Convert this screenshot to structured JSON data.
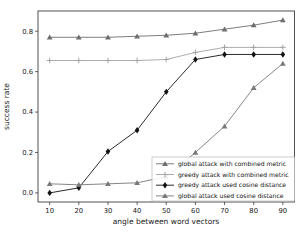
{
  "chart_data": {
    "type": "line",
    "title": "",
    "xlabel": "angle between word vectors",
    "ylabel": "success rate",
    "x": [
      10,
      20,
      30,
      40,
      50,
      60,
      70,
      80,
      90
    ],
    "xticks": [
      10,
      20,
      30,
      40,
      50,
      60,
      70,
      80,
      90
    ],
    "yticks": [
      0.0,
      0.2,
      0.4,
      0.6,
      0.8
    ],
    "xlim": [
      6,
      94
    ],
    "ylim": [
      -0.045,
      0.9
    ],
    "grid": false,
    "legend_position": "lower right",
    "axis_color": "#262626",
    "background_color": "#ffffff",
    "series": [
      {
        "name": "global attack with combined metric",
        "marker": "triangle",
        "color": "#6e6e6e",
        "values": [
          0.77,
          0.77,
          0.77,
          0.775,
          0.78,
          0.79,
          0.81,
          0.83,
          0.855
        ]
      },
      {
        "name": "greedy attack with combined metric",
        "marker": "plus",
        "color": "#a3a3a3",
        "values": [
          0.655,
          0.655,
          0.655,
          0.655,
          0.66,
          0.695,
          0.72,
          0.72,
          0.72
        ]
      },
      {
        "name": "greedy attack used cosine distance",
        "marker": "diamond",
        "color": "#141414",
        "values": [
          0.0,
          0.025,
          0.205,
          0.31,
          0.5,
          0.66,
          0.685,
          0.685,
          0.685
        ]
      },
      {
        "name": "global attack used cosine distance",
        "marker": "triangle",
        "color": "#787878",
        "values": [
          0.045,
          0.04,
          0.045,
          0.05,
          0.08,
          0.2,
          0.33,
          0.52,
          0.64
        ]
      }
    ]
  }
}
